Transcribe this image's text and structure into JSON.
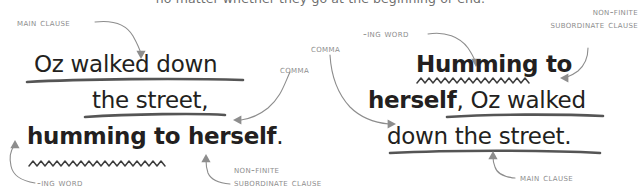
{
  "caption": {
    "cutoff_line": "no matter whether they go at the beginning or end."
  },
  "colors": {
    "text": "#231f20",
    "annotation": "#8d8d8d",
    "underline": "#555555",
    "squiggle": "#3d3d3d",
    "background": "#ffffff"
  },
  "examples": [
    {
      "id": "example-left",
      "lines": [
        {
          "id": "left-line-1",
          "text": "Oz walked down",
          "weight": "light"
        },
        {
          "id": "left-line-2",
          "text": "the street,",
          "weight": "light"
        },
        {
          "id": "left-line-3",
          "bold_part": "humming to herself",
          "plain_part": "."
        }
      ],
      "annotations": [
        {
          "id": "left-main-clause",
          "label": "main clause"
        },
        {
          "id": "left-comma",
          "label": "comma"
        },
        {
          "id": "left-ing-word",
          "label": "-ing word"
        },
        {
          "id": "left-non-finite",
          "line1": "non-finite",
          "line2": "subordinate clause"
        }
      ]
    },
    {
      "id": "example-right",
      "lines": [
        {
          "id": "right-line-1",
          "text": "Humming to",
          "weight": "bold"
        },
        {
          "id": "right-line-2",
          "bold_part": "herself",
          "plain_part": ", Oz walked"
        },
        {
          "id": "right-line-3",
          "text": "down the street.",
          "weight": "light"
        }
      ],
      "annotations": [
        {
          "id": "right-ing-word",
          "label": "-ing word"
        },
        {
          "id": "right-non-finite",
          "line1": "non-finite",
          "line2": "subordinate clause"
        },
        {
          "id": "right-comma",
          "label": "comma"
        },
        {
          "id": "right-main-clause",
          "label": "main clause"
        }
      ]
    }
  ]
}
